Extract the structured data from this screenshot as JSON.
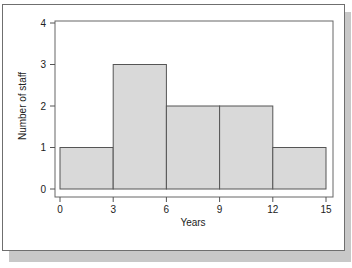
{
  "chart_data": {
    "type": "bar",
    "subtype": "histogram",
    "title": "",
    "xlabel": "Years",
    "ylabel": "Number of staff",
    "bins": [
      {
        "from": 0,
        "to": 3,
        "count": 1
      },
      {
        "from": 3,
        "to": 6,
        "count": 3
      },
      {
        "from": 6,
        "to": 9,
        "count": 2
      },
      {
        "from": 9,
        "to": 12,
        "count": 2
      },
      {
        "from": 12,
        "to": 15,
        "count": 1
      }
    ],
    "categories": [
      "0-3",
      "3-6",
      "6-9",
      "9-12",
      "12-15"
    ],
    "values": [
      1,
      3,
      2,
      2,
      1
    ],
    "xticks": [
      "0",
      "3",
      "6",
      "9",
      "12",
      "15"
    ],
    "yticks": [
      "0",
      "1",
      "2",
      "3",
      "4"
    ],
    "xlim": [
      0,
      15
    ],
    "ylim": [
      0,
      4
    ],
    "grid": false,
    "legend": null,
    "bar_color": "#d9d9d9",
    "edge_color": "#555555"
  }
}
